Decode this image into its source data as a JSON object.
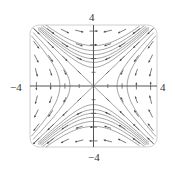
{
  "diagram": {
    "type": "direction-field",
    "window": {
      "xmin": -4,
      "xmax": 4,
      "ymin": -4,
      "ymax": 4
    },
    "labels": {
      "top": "4",
      "bottom": "−4",
      "left": "−4",
      "right": "4"
    },
    "colors": {
      "frame": "#cfcfcf",
      "axes": "#555555",
      "curves": "#8a8a8a",
      "arrows": "#444444",
      "separatrix": "#8a8a8a"
    },
    "curve_levels_vertical": [
      1.5,
      2.4,
      3.2,
      4.2,
      5.4,
      7.0
    ],
    "curve_levels_horizontal": [
      2.2,
      4.5
    ],
    "grid_spacing": 1
  }
}
